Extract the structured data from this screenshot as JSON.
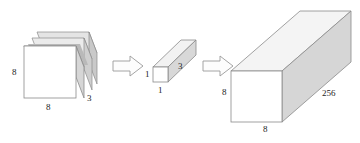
{
  "figure": {
    "name": "tensor-reshape-diagram",
    "background_color": "#ffffff",
    "stroke_color": "#8a8a8a",
    "dark_stroke_color": "#6f6f6f",
    "label_color": "#1d1d1d",
    "face_front_color": "#ffffff",
    "face_top_color": "#efefef",
    "face_side_color": "#d6d6d6",
    "face_shadow_color": "#b5b5b5",
    "arrow_fill_color": "#fdfdfd",
    "arrow_stroke_color": "#9a9a9a"
  },
  "shapes": [
    {
      "id": "input-cube",
      "name": "input-volume",
      "description": "8 by 8 by 3 layered volume",
      "dims": {
        "height": "8",
        "width": "8",
        "depth": "3"
      },
      "layers": 3
    },
    {
      "id": "flattened-bar",
      "name": "flattened-vector",
      "description": "1 by 1 by 3 elongated bar",
      "dims": {
        "height": "1",
        "width": "1",
        "depth": "3"
      },
      "layers": 1
    },
    {
      "id": "output-box",
      "name": "output-volume",
      "description": "8 by 8 by 256 deep volume",
      "dims": {
        "height": "8",
        "width": "8",
        "depth": "256"
      },
      "layers": 1
    }
  ],
  "arrows": [
    {
      "id": "arrow-1",
      "name": "transform-arrow-1",
      "direction": "right"
    },
    {
      "id": "arrow-2",
      "name": "transform-arrow-2",
      "direction": "right"
    }
  ],
  "labels": {
    "cube_height": "8",
    "cube_width": "8",
    "cube_depth": "3",
    "bar_height": "1",
    "bar_width": "1",
    "bar_depth": "3",
    "box_height": "8",
    "box_width": "8",
    "box_depth": "256"
  }
}
